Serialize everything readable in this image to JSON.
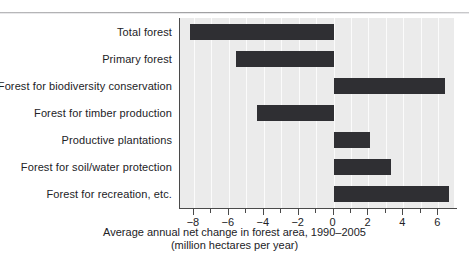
{
  "chart_data": {
    "type": "bar",
    "orientation": "horizontal",
    "title": "",
    "xlabel": "Average annual net change in forest area, 1990–2005 (million hectares per year)",
    "ylabel": "",
    "xlim": [
      -8.8,
      6.9
    ],
    "ylim": null,
    "grid": true,
    "grid_axis": "x",
    "legend": null,
    "legend_position": "none",
    "zero_line": 0,
    "units": "million hectares per year",
    "period": "1990–2005",
    "categories": [
      "Total forest",
      "Primary forest",
      "Forest for biodiversity conservation",
      "Forest for timber production",
      "Productive plantations",
      "Forest for soil/water protection",
      "Forest for recreation, etc."
    ],
    "values": [
      -8.2,
      -5.6,
      6.4,
      -4.4,
      2.1,
      3.3,
      6.6
    ],
    "tick_values": [
      -8,
      -6,
      -4,
      -2,
      0,
      2,
      4,
      6
    ],
    "tick_labels": [
      "−8",
      "−6",
      "−4",
      "−2",
      "0",
      "2",
      "4",
      "6"
    ],
    "minor_tick_step": 1,
    "bar_color": "#2f2f33",
    "plot_background": "#ebebeb",
    "gridline_color": "#fbfbfb",
    "axis_color": "#4a4a4a"
  },
  "axis_title": {
    "line1": "Average annual net change in forest area, 1990–2005",
    "line2": "(million hectares per year)"
  }
}
